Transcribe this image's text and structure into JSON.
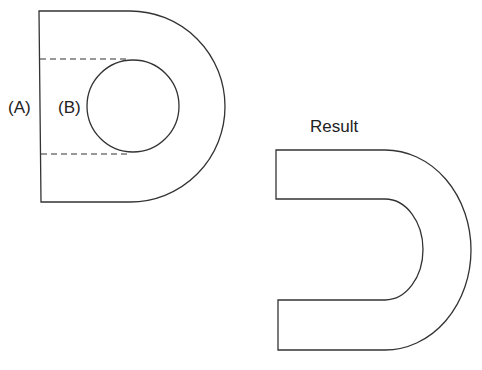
{
  "diagram": {
    "labels": {
      "a": "(A)",
      "b": "(B)",
      "result": "Result"
    },
    "colors": {
      "stroke": "#333333",
      "background": "#ffffff"
    },
    "shapes": {
      "shape_a": "D-shaped plate with straight left edge and semicircular right side",
      "shape_b": "Circle cut-out inside shape A, with dashed lines extending to left edge",
      "result": "U-shaped (horseshoe) outline produced by subtracting B from A"
    }
  }
}
